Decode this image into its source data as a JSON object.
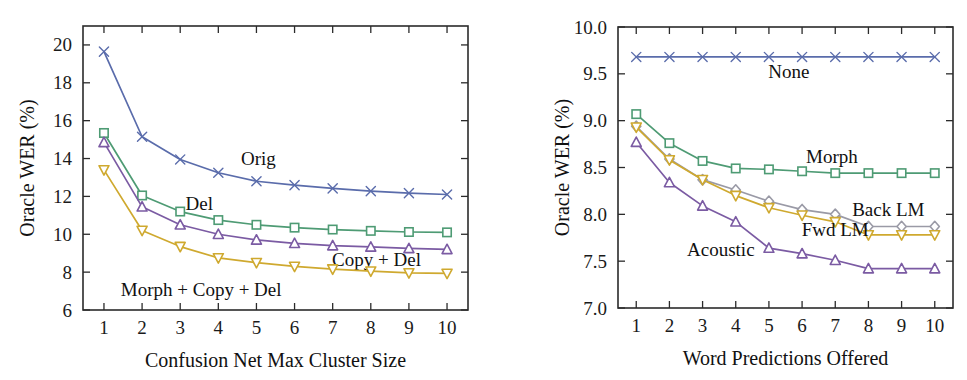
{
  "figure": {
    "background_color": "#ffffff",
    "panel_count": 2
  },
  "palette": {
    "blue": "#5a6cab",
    "green": "#4e9b74",
    "purple": "#7b5ba3",
    "gold": "#cfa92f",
    "gray_diamond": "#9a9aa6",
    "axis": "#2b2b2b",
    "text": "#111111"
  },
  "chart_data": [
    {
      "id": "left",
      "type": "line",
      "title": "",
      "xlabel": "Confusion Net Max Cluster Size",
      "ylabel": "Oracle WER (%)",
      "x": [
        1,
        2,
        3,
        4,
        5,
        6,
        7,
        8,
        9,
        10
      ],
      "xticklabels": [
        "1",
        "2",
        "3",
        "4",
        "5",
        "6",
        "7",
        "8",
        "9",
        "10"
      ],
      "yticklabels": [
        "6",
        "8",
        "10",
        "12",
        "14",
        "16",
        "18",
        "20"
      ],
      "yticks": [
        6,
        8,
        10,
        12,
        14,
        16,
        18,
        20
      ],
      "xlim": [
        0.45,
        10.55
      ],
      "ylim": [
        6.0,
        21.0
      ],
      "grid": false,
      "legend_position": "inline-annotations",
      "series": [
        {
          "name": "Orig",
          "color": "#5a6cab",
          "marker": "x",
          "values": [
            19.65,
            15.15,
            13.95,
            13.25,
            12.8,
            12.6,
            12.42,
            12.28,
            12.17,
            12.1
          ],
          "annotation": "Orig",
          "annot_x": 5.05,
          "annot_y": 13.95,
          "annot_anchor": "middle"
        },
        {
          "name": "Del",
          "color": "#4e9b74",
          "marker": "square",
          "values": [
            15.35,
            12.05,
            11.2,
            10.75,
            10.5,
            10.35,
            10.25,
            10.18,
            10.12,
            10.1
          ],
          "annotation": "Del",
          "annot_x": 3.5,
          "annot_y": 11.6,
          "annot_anchor": "middle"
        },
        {
          "name": "Copy + Del",
          "color": "#7b5ba3",
          "marker": "triangle-up",
          "values": [
            14.85,
            11.45,
            10.5,
            10.0,
            9.7,
            9.52,
            9.4,
            9.33,
            9.25,
            9.2
          ],
          "annotation": "Copy + Del",
          "annot_x": 8.15,
          "annot_y": 8.62,
          "annot_anchor": "middle"
        },
        {
          "name": "Morph + Copy + Del",
          "color": "#cfa92f",
          "marker": "triangle-down",
          "values": [
            13.4,
            10.2,
            9.35,
            8.75,
            8.5,
            8.3,
            8.16,
            8.05,
            7.96,
            7.93
          ],
          "annotation": "Morph + Copy + Del",
          "annot_x": 3.55,
          "annot_y": 7.05,
          "annot_anchor": "middle"
        }
      ]
    },
    {
      "id": "right",
      "type": "line",
      "title": "",
      "xlabel": "Word Predictions Offered",
      "ylabel": "Oracle WER (%)",
      "x": [
        1,
        2,
        3,
        4,
        5,
        6,
        7,
        8,
        9,
        10
      ],
      "xticklabels": [
        "1",
        "2",
        "3",
        "4",
        "5",
        "6",
        "7",
        "8",
        "9",
        "10"
      ],
      "yticklabels": [
        "7.0",
        "7.5",
        "8.0",
        "8.5",
        "9.0",
        "9.5",
        "10.0"
      ],
      "yticks": [
        7.0,
        7.5,
        8.0,
        8.5,
        9.0,
        9.5,
        10.0
      ],
      "xlim": [
        0.45,
        10.55
      ],
      "ylim": [
        7.0,
        10.0
      ],
      "grid": false,
      "legend_position": "inline-annotations",
      "series": [
        {
          "name": "None",
          "color": "#5a6cab",
          "marker": "x",
          "values": [
            9.68,
            9.68,
            9.68,
            9.68,
            9.68,
            9.68,
            9.68,
            9.68,
            9.68,
            9.68
          ],
          "annotation": "None",
          "annot_x": 5.6,
          "annot_y": 9.52,
          "annot_anchor": "middle"
        },
        {
          "name": "Morph",
          "color": "#4e9b74",
          "marker": "square",
          "values": [
            9.07,
            8.76,
            8.57,
            8.49,
            8.48,
            8.46,
            8.44,
            8.44,
            8.44,
            8.44
          ],
          "annotation": "Morph",
          "annot_x": 6.9,
          "annot_y": 8.61,
          "annot_anchor": "middle"
        },
        {
          "name": "Back LM",
          "color": "#9a9aa6",
          "marker": "diamond",
          "values": [
            8.94,
            8.59,
            8.37,
            8.26,
            8.14,
            8.05,
            8.0,
            7.87,
            7.87,
            7.87
          ],
          "annotation": "Back LM",
          "annot_x": 8.6,
          "annot_y": 8.05,
          "annot_anchor": "middle"
        },
        {
          "name": "Fwd LM",
          "color": "#cfa92f",
          "marker": "triangle-down",
          "values": [
            8.93,
            8.58,
            8.37,
            8.2,
            8.07,
            7.99,
            7.92,
            7.78,
            7.78,
            7.78
          ],
          "annotation": "Fwd LM",
          "annot_x": 7.0,
          "annot_y": 7.83,
          "annot_anchor": "middle"
        },
        {
          "name": "Acoustic",
          "color": "#7b5ba3",
          "marker": "triangle-up",
          "values": [
            8.77,
            8.34,
            8.09,
            7.92,
            7.64,
            7.58,
            7.51,
            7.42,
            7.42,
            7.42
          ],
          "annotation": "Acoustic",
          "annot_x": 3.55,
          "annot_y": 7.62,
          "annot_anchor": "middle"
        }
      ]
    }
  ]
}
